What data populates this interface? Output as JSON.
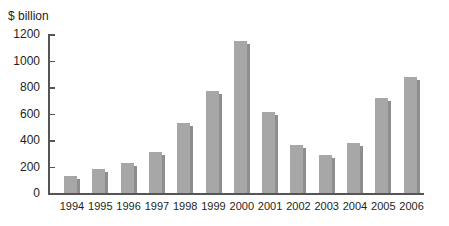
{
  "chart_data": {
    "type": "bar",
    "title": "",
    "xlabel": "",
    "ylabel": "$ billion",
    "ylim": [
      0,
      1200
    ],
    "yticks": [
      0,
      200,
      400,
      600,
      800,
      1000,
      1200
    ],
    "grid": false,
    "legend": null,
    "categories": [
      "1994",
      "1995",
      "1996",
      "1997",
      "1998",
      "1999",
      "2000",
      "2001",
      "2002",
      "2003",
      "2004",
      "2005",
      "2006"
    ],
    "values": [
      130,
      180,
      225,
      310,
      530,
      770,
      1150,
      615,
      365,
      285,
      380,
      715,
      875
    ],
    "bar_color": "#a7a7a7",
    "bar_shadow_color": "#8e8e8e"
  }
}
